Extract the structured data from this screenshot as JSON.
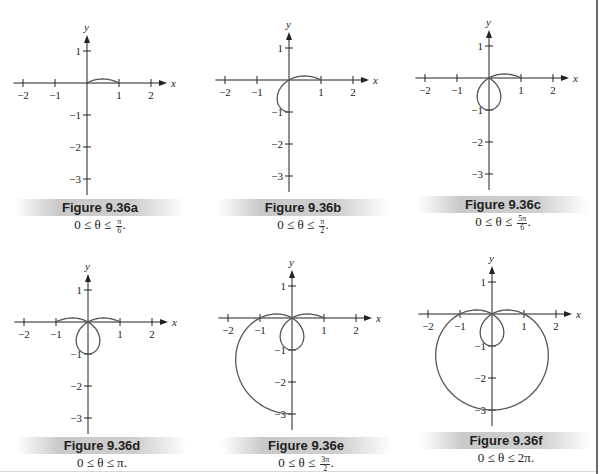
{
  "chart_data": [
    {
      "id": "a",
      "type": "line",
      "title": "Figure 9.36a",
      "subtitle": "0 ≤ θ ≤ π/6.",
      "equation": "r = 1 − 2 sin θ",
      "theta_range": [
        0,
        0.5236
      ],
      "theta_end_label": "π/6",
      "xlabel": "x",
      "ylabel": "y",
      "xticks": [
        -2,
        -1,
        1,
        2
      ],
      "yticks": [
        1,
        -1,
        -2,
        -3
      ],
      "xlim": [
        -2.3,
        2.5
      ],
      "ylim": [
        -3.5,
        1.5
      ],
      "grid": false
    },
    {
      "id": "b",
      "type": "line",
      "title": "Figure 9.36b",
      "subtitle": "0 ≤ θ ≤ π/2.",
      "equation": "r = 1 − 2 sin θ",
      "theta_range": [
        0,
        1.5708
      ],
      "theta_end_label": "π/2",
      "xlabel": "x",
      "ylabel": "y",
      "xticks": [
        -2,
        -1,
        1,
        2
      ],
      "yticks": [
        1,
        -1,
        -2,
        -3
      ],
      "xlim": [
        -2.3,
        2.5
      ],
      "ylim": [
        -3.5,
        1.5
      ],
      "grid": false
    },
    {
      "id": "c",
      "type": "line",
      "title": "Figure 9.36c",
      "subtitle": "0 ≤ θ ≤ 5π/6.",
      "equation": "r = 1 − 2 sin θ",
      "theta_range": [
        0,
        2.618
      ],
      "theta_end_label": "5π/6",
      "xlabel": "x",
      "ylabel": "y",
      "xticks": [
        -2,
        -1,
        1,
        2
      ],
      "yticks": [
        1,
        -1,
        -2,
        -3
      ],
      "xlim": [
        -2.3,
        2.5
      ],
      "ylim": [
        -3.5,
        1.5
      ],
      "grid": false
    },
    {
      "id": "d",
      "type": "line",
      "title": "Figure 9.36d",
      "subtitle": "0 ≤ θ ≤ π.",
      "equation": "r = 1 − 2 sin θ",
      "theta_range": [
        0,
        3.1416
      ],
      "theta_end_label": "π",
      "xlabel": "x",
      "ylabel": "y",
      "xticks": [
        -2,
        -1,
        1,
        2
      ],
      "yticks": [
        1,
        -1,
        -2,
        -3
      ],
      "xlim": [
        -2.3,
        2.5
      ],
      "ylim": [
        -3.5,
        1.5
      ],
      "grid": false
    },
    {
      "id": "e",
      "type": "line",
      "title": "Figure 9.36e",
      "subtitle": "0 ≤ θ ≤ 3π/2.",
      "equation": "r = 1 − 2 sin θ",
      "theta_range": [
        0,
        4.7124
      ],
      "theta_end_label": "3π/2",
      "xlabel": "x",
      "ylabel": "y",
      "xticks": [
        -2,
        -1,
        1,
        2
      ],
      "yticks": [
        1,
        -1,
        -2,
        -3
      ],
      "xlim": [
        -2.3,
        2.5
      ],
      "ylim": [
        -3.5,
        1.5
      ],
      "grid": false
    },
    {
      "id": "f",
      "type": "line",
      "title": "Figure 9.36f",
      "subtitle": "0 ≤ θ ≤ 2π.",
      "equation": "r = 1 − 2 sin θ",
      "theta_range": [
        0,
        6.2832
      ],
      "theta_end_label": "2π",
      "xlabel": "x",
      "ylabel": "y",
      "xticks": [
        -2,
        -1,
        1,
        2
      ],
      "yticks": [
        1,
        -1,
        -2,
        -3
      ],
      "xlim": [
        -2.3,
        2.5
      ],
      "ylim": [
        -3.5,
        1.5
      ],
      "grid": false
    }
  ],
  "layout": {
    "unit_px": 32,
    "origins": [
      [
        87,
        83
      ],
      [
        289,
        80
      ],
      [
        489,
        78
      ],
      [
        88,
        322
      ],
      [
        292,
        318
      ],
      [
        492,
        314
      ]
    ],
    "captions_top": [
      199,
      199,
      196,
      437,
      437,
      432
    ],
    "colors": {
      "axis": "#222222",
      "curve": "#555555",
      "text": "#222222"
    }
  },
  "captions": [
    {
      "title": "Figure 9.36a",
      "prefix": "0 ≤ θ ≤ ",
      "num": "π",
      "den": "6",
      "suffix": "."
    },
    {
      "title": "Figure 9.36b",
      "prefix": "0 ≤ θ ≤ ",
      "num": "π",
      "den": "2",
      "suffix": "."
    },
    {
      "title": "Figure 9.36c",
      "prefix": "0 ≤ θ ≤ ",
      "num": "5π",
      "den": "6",
      "suffix": "."
    },
    {
      "title": "Figure 9.36d",
      "prefix": "0 ≤ θ ≤ π.",
      "num": null,
      "den": null,
      "suffix": ""
    },
    {
      "title": "Figure 9.36e",
      "prefix": "0 ≤ θ ≤ ",
      "num": "3π",
      "den": "2",
      "suffix": "."
    },
    {
      "title": "Figure 9.36f",
      "prefix": "0 ≤ θ ≤ 2π.",
      "num": null,
      "den": null,
      "suffix": ""
    }
  ]
}
